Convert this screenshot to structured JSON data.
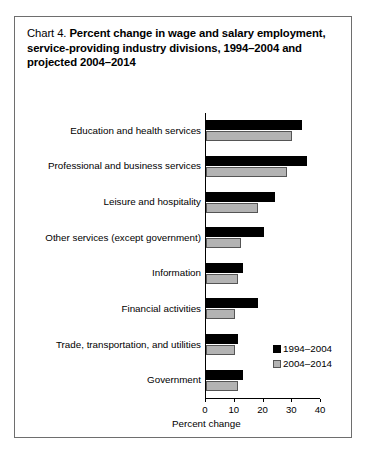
{
  "title": {
    "prefix": "Chart 4.",
    "main": "Percent change in wage and salary employment, service-providing industry divisions, 1994–2004 and projected 2004–2014"
  },
  "legend": {
    "entries": [
      {
        "label": "1994–2004",
        "color": "#000000"
      },
      {
        "label": "2004–2014",
        "color": "#b3b3b3"
      }
    ]
  },
  "axis": {
    "x_title": "Percent change",
    "ticks": [
      "0",
      "10",
      "20",
      "30",
      "40"
    ]
  },
  "chart_data": {
    "type": "bar",
    "orientation": "horizontal",
    "title": "Chart 4. Percent change in wage and salary employment, service-providing industry divisions, 1994–2004 and projected 2004–2014",
    "xlabel": "Percent change",
    "ylabel": "",
    "xlim": [
      0,
      40
    ],
    "xticks": [
      0,
      10,
      20,
      30,
      40
    ],
    "grid": false,
    "legend_position": "inside-bottom-right",
    "categories": [
      "Education and health services",
      "Professional and business services",
      "Leisure and hospitality",
      "Other services (except government)",
      "Information",
      "Financial activities",
      "Trade, transportation, and utilities",
      "Government"
    ],
    "series": [
      {
        "name": "1994–2004",
        "color": "#000000",
        "values": [
          33.5,
          35.0,
          24.0,
          20.0,
          13.0,
          18.0,
          11.0,
          13.0
        ]
      },
      {
        "name": "2004–2014",
        "color": "#b3b3b3",
        "values": [
          30.0,
          28.0,
          18.0,
          12.0,
          11.0,
          10.0,
          10.0,
          11.0
        ]
      }
    ]
  }
}
